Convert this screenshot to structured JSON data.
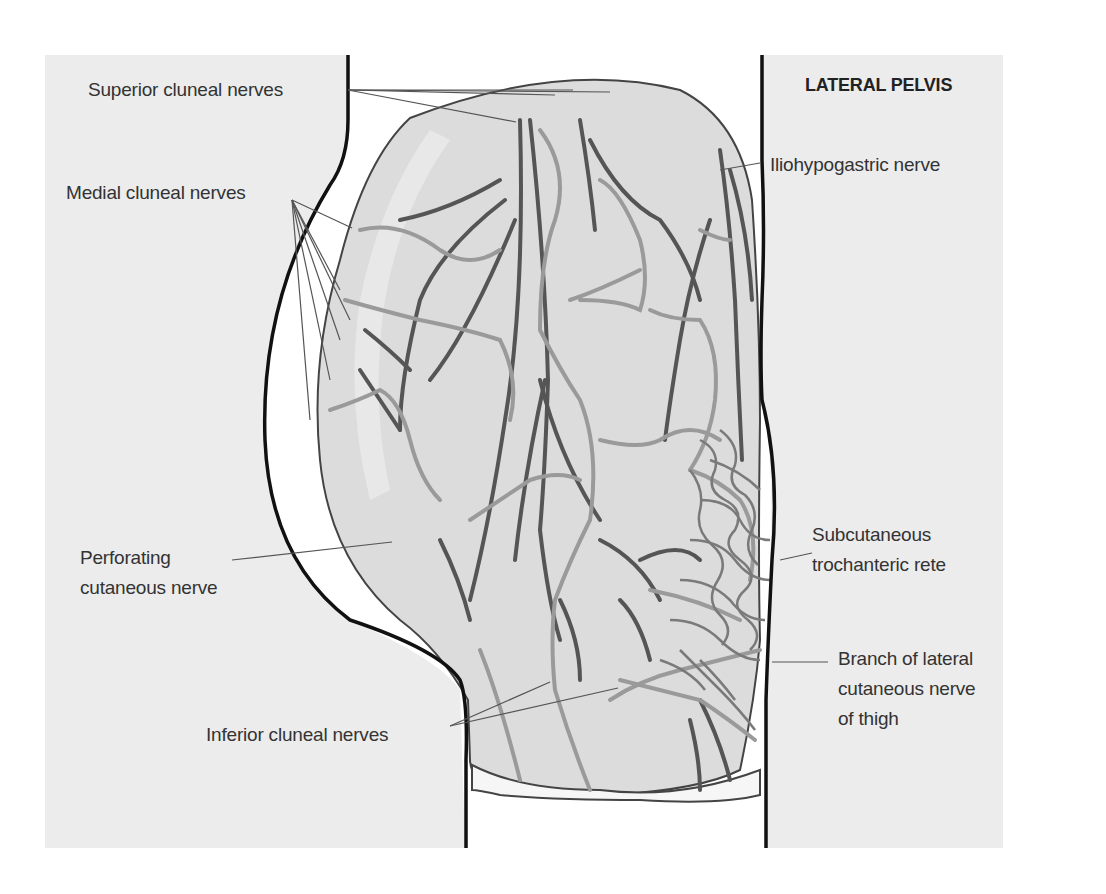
{
  "figure": {
    "title": "LATERAL PELVIS",
    "colors": {
      "background_panel": "#ececec",
      "page": "#ffffff",
      "body_outline": "#111111",
      "tissue_fill": "#dcdcdc",
      "tissue_highlight": "#e8e8e8",
      "dark_nerve": "#555555",
      "light_nerve": "#9a9a9a",
      "leader_line": "#555555",
      "label_text": "#333333"
    }
  },
  "labels": [
    {
      "id": "superior-cluneal-nerves",
      "lines": [
        "Superior cluneal nerves"
      ],
      "x": 88,
      "y": 75,
      "anchor": [
        348,
        90
      ]
    },
    {
      "id": "medial-cluneal-nerves",
      "lines": [
        "Medial cluneal nerves"
      ],
      "x": 66,
      "y": 178,
      "anchor": [
        292,
        200
      ]
    },
    {
      "id": "perforating-cutaneous-nerve",
      "lines": [
        "Perforating",
        "cutaneous nerve"
      ],
      "x": 80,
      "y": 543,
      "anchor": [
        232,
        560
      ]
    },
    {
      "id": "inferior-cluneal-nerves",
      "lines": [
        "Inferior cluneal nerves"
      ],
      "x": 206,
      "y": 720,
      "anchor": [
        450,
        726
      ]
    },
    {
      "id": "iliohypogastric-nerve",
      "lines": [
        "Iliohypogastric nerve"
      ],
      "x": 770,
      "y": 150,
      "anchor": [
        760,
        163
      ]
    },
    {
      "id": "subcutaneous-trochanteric-rete",
      "lines": [
        "Subcutaneous",
        "trochanteric rete"
      ],
      "x": 812,
      "y": 520,
      "anchor": [
        812,
        553
      ]
    },
    {
      "id": "branch-lateral-cutaneous-nerve-thigh",
      "lines": [
        "Branch of lateral",
        "cutaneous nerve",
        "of thigh"
      ],
      "x": 838,
      "y": 644,
      "anchor": [
        828,
        662
      ]
    }
  ],
  "leaders": [
    {
      "label": "superior-cluneal-nerves",
      "targets": [
        [
          516,
          122
        ],
        [
          555,
          95
        ],
        [
          573,
          90
        ],
        [
          610,
          92
        ]
      ]
    },
    {
      "label": "medial-cluneal-nerves",
      "targets": [
        [
          352,
          228
        ],
        [
          340,
          290
        ],
        [
          350,
          320
        ],
        [
          340,
          340
        ],
        [
          330,
          380
        ],
        [
          310,
          420
        ]
      ]
    },
    {
      "label": "perforating-cutaneous-nerve",
      "targets": [
        [
          392,
          542
        ]
      ]
    },
    {
      "label": "inferior-cluneal-nerves",
      "targets": [
        [
          550,
          682
        ],
        [
          618,
          688
        ]
      ]
    },
    {
      "label": "iliohypogastric-nerve",
      "targets": [
        [
          720,
          170
        ]
      ]
    },
    {
      "label": "subcutaneous-trochanteric-rete",
      "targets": [
        [
          780,
          560
        ]
      ]
    },
    {
      "label": "branch-lateral-cutaneous-nerve-thigh",
      "targets": [
        [
          772,
          662
        ]
      ]
    }
  ]
}
